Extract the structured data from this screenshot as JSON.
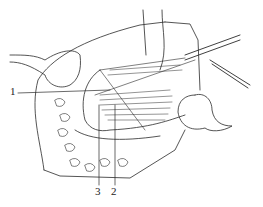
{
  "figure": {
    "type": "surgical line illustration",
    "labels": [
      {
        "id": "1",
        "text": "1",
        "x": 12,
        "y": 90
      },
      {
        "id": "2",
        "text": "2",
        "x": 111,
        "y": 186
      },
      {
        "id": "3",
        "text": "3",
        "x": 95,
        "y": 186
      }
    ],
    "colors": {
      "ink": "#2a2a2a",
      "background": "#ffffff"
    }
  }
}
